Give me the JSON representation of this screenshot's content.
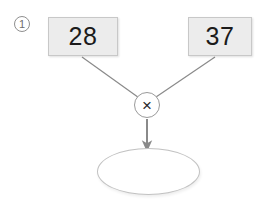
{
  "diagram": {
    "title": "",
    "type": "arithmetic-flow",
    "step_badge": {
      "label": "1",
      "icon": "circled-number-icon"
    },
    "operands": [
      {
        "id": "left",
        "value": "28"
      },
      {
        "id": "right",
        "value": "37"
      }
    ],
    "operator": {
      "symbol": "×",
      "name": "multiply-icon",
      "label": "multiply"
    },
    "result": {
      "value": "",
      "placeholder": ""
    },
    "connectors": [
      {
        "from": "operand-left",
        "to": "operator"
      },
      {
        "from": "operand-right",
        "to": "operator"
      },
      {
        "from": "operator",
        "to": "result",
        "arrow": true
      }
    ],
    "colors": {
      "background": "#ffffff",
      "box_fill": "#ececec",
      "box_border": "#c8c8c8",
      "line": "#8a8a8a",
      "text": "#1b1b1b",
      "node_border": "#9a9a9a",
      "ellipse_border": "#c2c2c2"
    }
  }
}
